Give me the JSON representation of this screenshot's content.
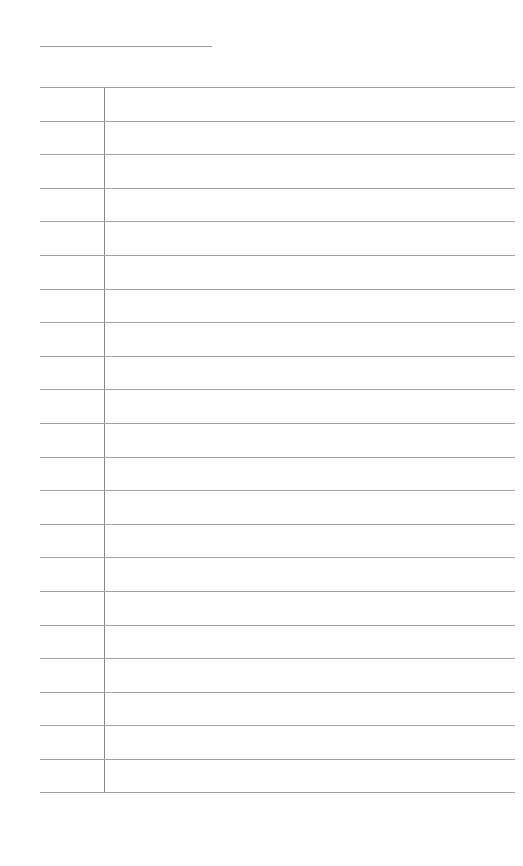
{
  "page": {
    "title": "",
    "heading_line_value": ""
  },
  "ledger": {
    "row_count": 21,
    "rows": [
      {
        "label": "",
        "entry": ""
      },
      {
        "label": "",
        "entry": ""
      },
      {
        "label": "",
        "entry": ""
      },
      {
        "label": "",
        "entry": ""
      },
      {
        "label": "",
        "entry": ""
      },
      {
        "label": "",
        "entry": ""
      },
      {
        "label": "",
        "entry": ""
      },
      {
        "label": "",
        "entry": ""
      },
      {
        "label": "",
        "entry": ""
      },
      {
        "label": "",
        "entry": ""
      },
      {
        "label": "",
        "entry": ""
      },
      {
        "label": "",
        "entry": ""
      },
      {
        "label": "",
        "entry": ""
      },
      {
        "label": "",
        "entry": ""
      },
      {
        "label": "",
        "entry": ""
      },
      {
        "label": "",
        "entry": ""
      },
      {
        "label": "",
        "entry": ""
      },
      {
        "label": "",
        "entry": ""
      },
      {
        "label": "",
        "entry": ""
      },
      {
        "label": "",
        "entry": ""
      },
      {
        "label": "",
        "entry": ""
      }
    ]
  },
  "colors": {
    "background": "#ffffff",
    "rule_line": "#a3a3a3",
    "column_divider": "#8a8a8a"
  }
}
